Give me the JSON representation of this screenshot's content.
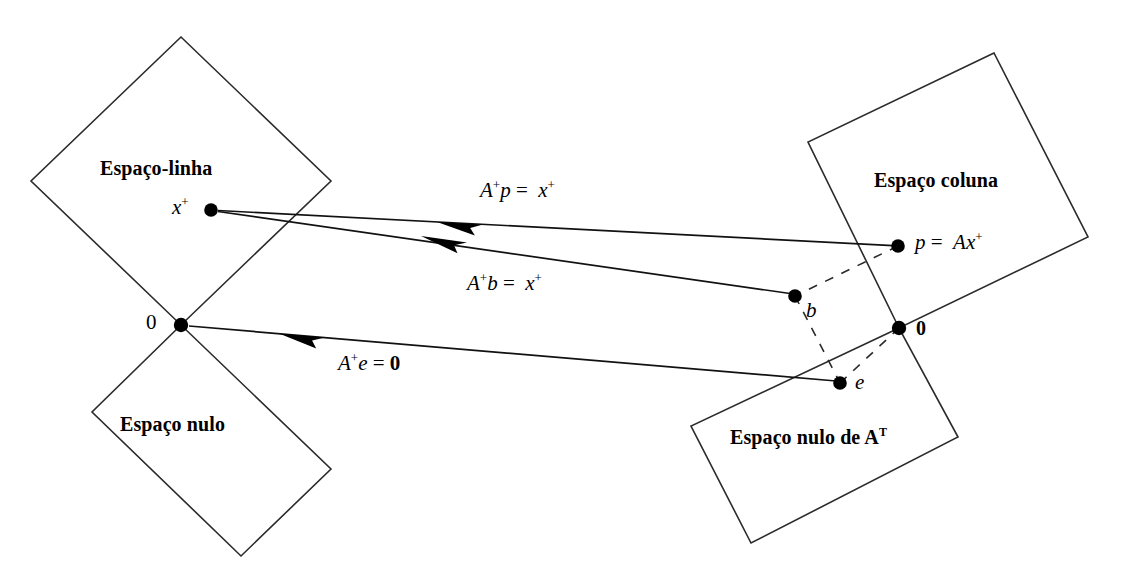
{
  "figure": {
    "type": "linear-algebra-four-subspaces-diagram",
    "language": "pt-BR",
    "background_color": "#ffffff",
    "stroke_color": "#1a1a1a",
    "canvas": {
      "width": 1124,
      "height": 583
    }
  },
  "subspaces": [
    {
      "id": "row-space",
      "label": "Espaço-linha",
      "shape": "diamond",
      "vertices": [
        [
          181,
          37
        ],
        [
          31,
          181
        ],
        [
          181,
          325
        ],
        [
          331,
          181
        ]
      ],
      "label_pos": [
        100,
        158
      ]
    },
    {
      "id": "null-space",
      "label": "Espaço nulo",
      "shape": "diamond",
      "vertices": [
        [
          181,
          325
        ],
        [
          92,
          412
        ],
        [
          241,
          556
        ],
        [
          331,
          469
        ]
      ],
      "label_pos": [
        120,
        414
      ]
    },
    {
      "id": "column-space",
      "label": "Espaço coluna",
      "shape": "quadrilateral",
      "vertices": [
        [
          994,
          53
        ],
        [
          808,
          142
        ],
        [
          899,
          328
        ],
        [
          1088,
          237
        ]
      ],
      "label_pos": [
        874,
        170
      ]
    },
    {
      "id": "left-null-space",
      "label": "Espaço nulo de A",
      "label_sup": "T",
      "shape": "quadrilateral",
      "vertices": [
        [
          899,
          328
        ],
        [
          691,
          426
        ],
        [
          751,
          543
        ],
        [
          958,
          437
        ]
      ],
      "label_pos": [
        730,
        427
      ]
    }
  ],
  "points": [
    {
      "id": "x-plus",
      "label": "x",
      "sup": "+",
      "x": 211,
      "y": 210,
      "label_pos": [
        172,
        199
      ],
      "radius": 6.5,
      "bold_label": false
    },
    {
      "id": "origin-left",
      "label": "0",
      "sup": "",
      "x": 181,
      "y": 325,
      "label_pos": [
        146,
        313
      ],
      "radius": 7.0,
      "bold_label": false
    },
    {
      "id": "p",
      "label": "p",
      "sup": "",
      "x": 898,
      "y": 246,
      "label_pos": [
        915,
        233
      ],
      "radius": 6.5,
      "bold_label": false
    },
    {
      "id": "b",
      "label": "b",
      "sup": "",
      "x": 795,
      "y": 296,
      "label_pos": [
        806,
        303
      ],
      "radius": 6.5,
      "bold_label": false
    },
    {
      "id": "origin-right",
      "label": "0",
      "sup": "",
      "x": 899,
      "y": 328,
      "label_pos": [
        915,
        318
      ],
      "radius": 7.0,
      "bold_label": true
    },
    {
      "id": "e",
      "label": "e",
      "sup": "",
      "x": 840,
      "y": 383,
      "label_pos": [
        855,
        374
      ],
      "radius": 6.5,
      "bold_label": false
    }
  ],
  "arrows": [
    {
      "id": "A-plus-p",
      "from": [
        898,
        246
      ],
      "to": [
        211,
        210
      ],
      "head_at": [
        455,
        224
      ],
      "label": {
        "lhs": "A",
        "lhs_sup": "+",
        "mid": "p",
        "op": "=",
        "rhs": "x",
        "rhs_sup": "+"
      },
      "label_pos": [
        480,
        182
      ]
    },
    {
      "id": "A-plus-b",
      "from": [
        790,
        294
      ],
      "to": [
        211,
        210
      ],
      "head_at": [
        441,
        238
      ],
      "label": {
        "lhs": "A",
        "lhs_sup": "+",
        "mid": "b",
        "op": "=",
        "rhs": "x",
        "rhs_sup": "+"
      },
      "label_pos": [
        467,
        275
      ]
    },
    {
      "id": "A-plus-e",
      "from": [
        836,
        381
      ],
      "to": [
        181,
        325
      ],
      "head_at": [
        300,
        336
      ],
      "label": {
        "lhs": "A",
        "lhs_sup": "+",
        "mid": "e",
        "op": "=",
        "rhs": "0",
        "rhs_bold": true
      },
      "label_pos": [
        338,
        355
      ]
    }
  ],
  "dashed_segments": [
    {
      "id": "p-to-b",
      "from": [
        898,
        246
      ],
      "to": [
        795,
        296
      ]
    },
    {
      "id": "b-to-e",
      "from": [
        795,
        296
      ],
      "to": [
        840,
        383
      ]
    },
    {
      "id": "e-to-0",
      "from": [
        840,
        383
      ],
      "to": [
        899,
        328
      ]
    }
  ],
  "labels": {
    "row_space": "Espaço-linha",
    "null_space": "Espaço nulo",
    "column_space": "Espaço coluna",
    "left_null_space_base": "Espaço nulo de A",
    "left_null_space_sup": "T",
    "x_plus": "x",
    "x_plus_sup": "+",
    "origin_left": "0",
    "origin_right": "0",
    "p_label_lhs": "p",
    "p_label_op": "=",
    "p_label_rhs": "Ax",
    "p_label_sup": "+",
    "b_label": "b",
    "e_label": "e",
    "eq_Ap_lhs": "A",
    "eq_Ap_sup": "+",
    "eq_Ap_mid": "p",
    "eq_Ap_op": "=",
    "eq_Ap_rhs": "x",
    "eq_Ap_rhs_sup": "+",
    "eq_Ab_lhs": "A",
    "eq_Ab_sup": "+",
    "eq_Ab_mid": "b",
    "eq_Ab_op": "=",
    "eq_Ab_rhs": "x",
    "eq_Ab_rhs_sup": "+",
    "eq_Ae_lhs": "A",
    "eq_Ae_sup": "+",
    "eq_Ae_mid": "e",
    "eq_Ae_op": "=",
    "eq_Ae_rhs": "0"
  }
}
